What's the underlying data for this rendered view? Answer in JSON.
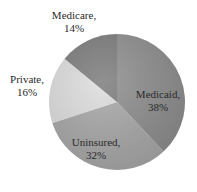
{
  "chart_data": {
    "type": "pie",
    "title": "",
    "categories": [
      "Medicaid",
      "Uninsured",
      "Private",
      "Medicare"
    ],
    "values": [
      38,
      32,
      16,
      14
    ],
    "unit": "%",
    "start_angle_deg": 0,
    "direction": "clockwise",
    "colors": [
      "#8f8f8f",
      "#a9a9a9",
      "#dedede",
      "#7d7d7d"
    ],
    "labels": [
      {
        "name": "Medicaid,",
        "value": "38%",
        "x": 158,
        "y": 88
      },
      {
        "name": "Uninsured,",
        "value": "32%",
        "x": 96,
        "y": 136
      },
      {
        "name": "Private,",
        "value": "16%",
        "x": 27,
        "y": 73
      },
      {
        "name": "Medicare,",
        "value": "14%",
        "x": 74,
        "y": 9
      }
    ],
    "legend": "none"
  }
}
